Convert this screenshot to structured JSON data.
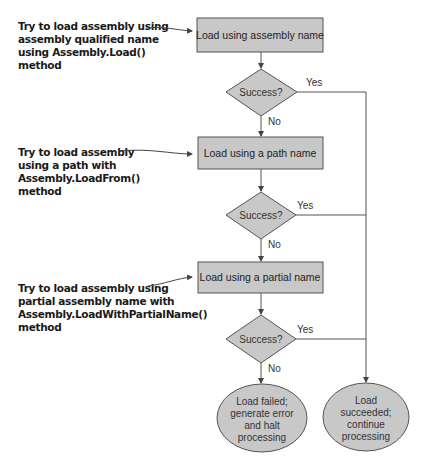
{
  "colors": {
    "box_fill": "#c8c8c8",
    "box_stroke": "#555555",
    "line": "#555555",
    "text": "#222222"
  },
  "annotations": [
    {
      "lines": [
        "Try to load assembly using",
        "assembly qualified name",
        "using Assembly.Load()",
        "method"
      ]
    },
    {
      "lines": [
        "Try to load assembly",
        "using a path with",
        "Assembly.LoadFrom()",
        "method"
      ]
    },
    {
      "lines": [
        "Try to load assembly using",
        "partial assembly name with",
        "Assembly.LoadWithPartialName()",
        "method"
      ]
    }
  ],
  "steps": [
    {
      "label": "Load using assembly name"
    },
    {
      "label": "Load using a path name"
    },
    {
      "label": "Load using a partial name"
    }
  ],
  "decisions": [
    {
      "label": "Success?",
      "yes": "Yes",
      "no": "No"
    },
    {
      "label": "Success?",
      "yes": "Yes",
      "no": "No"
    },
    {
      "label": "Success?",
      "yes": "Yes",
      "no": "No"
    }
  ],
  "terminals": {
    "failed": {
      "lines": [
        "Load failed;",
        "generate error",
        "and halt",
        "processing"
      ]
    },
    "succeeded": {
      "lines": [
        "Load",
        "succeeded;",
        "continue",
        "processing"
      ]
    }
  }
}
